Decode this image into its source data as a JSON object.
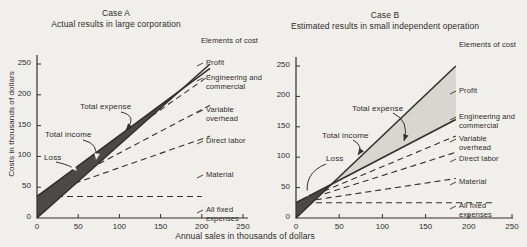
{
  "page": {
    "background": "#f1efec",
    "ink_color": "#34302b",
    "loss_fill_color": "#4b4a46",
    "profit_fill_color": "#d8d6d1"
  },
  "shared": {
    "x_axis_label": "Annual sales in thousands of dollars"
  },
  "chart_data": [
    {
      "type": "line",
      "title": "Case A",
      "subtitle": "Actual results in large corporation",
      "elements_header": "Elements of cost",
      "ylabel": "Costs in thousands of dollars",
      "xlim": [
        0,
        255
      ],
      "ylim": [
        0,
        265
      ],
      "x_ticks": [
        0,
        50,
        100,
        150,
        200,
        250
      ],
      "y_ticks": [
        0,
        50,
        100,
        150,
        200,
        250
      ],
      "grid": false,
      "legend_position": "right-margin",
      "break_even_sales_k": 175,
      "series": [
        {
          "name": "Total income",
          "style": "solid",
          "points": [
            [
              0,
              0
            ],
            [
              210,
              250
            ]
          ]
        },
        {
          "name": "Total expense",
          "style": "solid",
          "points": [
            [
              0,
              35
            ],
            [
              210,
              243
            ]
          ]
        },
        {
          "name": "Fixed + material + direct labor + variable overhead",
          "style": "dashed",
          "points": [
            [
              0,
              35
            ],
            [
              210,
              232
            ]
          ]
        },
        {
          "name": "Fixed + material + direct labor",
          "style": "dashed",
          "points": [
            [
              0,
              35
            ],
            [
              210,
              183
            ]
          ]
        },
        {
          "name": "Fixed + material",
          "style": "dashed",
          "points": [
            [
              0,
              35
            ],
            [
              210,
              133
            ]
          ]
        },
        {
          "name": "All fixed expenses",
          "style": "dashed",
          "points": [
            [
              0,
              35
            ],
            [
              200,
              35
            ]
          ]
        }
      ],
      "regions": [
        {
          "name": "Loss",
          "shade": "dark",
          "polygon": [
            [
              0,
              0
            ],
            [
              175,
              208
            ],
            [
              0,
              35
            ]
          ]
        }
      ],
      "annotations": [
        "Total expense",
        "Total income",
        "Loss"
      ],
      "cost_labels": [
        "Profit",
        "Engineering and commercial",
        "Variable overhead",
        "Direct labor",
        "Material",
        "All fixed expenses"
      ]
    },
    {
      "type": "line",
      "title": "Case B",
      "subtitle": "Estimated results in small independent operation",
      "elements_header": "Elements of cost",
      "ylabel": "",
      "xlim": [
        0,
        255
      ],
      "ylim": [
        0,
        265
      ],
      "x_ticks": [
        0,
        50,
        100,
        150,
        200,
        250
      ],
      "y_ticks": [
        0,
        50,
        100,
        150,
        200,
        250
      ],
      "grid": false,
      "legend_position": "right-margin",
      "break_even_sales_k": 41,
      "series": [
        {
          "name": "Total income",
          "style": "solid",
          "points": [
            [
              0,
              0
            ],
            [
              185,
              250
            ]
          ]
        },
        {
          "name": "Total expense",
          "style": "solid",
          "points": [
            [
              0,
              25
            ],
            [
              185,
              162
            ]
          ]
        },
        {
          "name": "Fixed + material + direct labor + variable overhead",
          "style": "dashed",
          "points": [
            [
              0,
              25
            ],
            [
              185,
              135
            ]
          ]
        },
        {
          "name": "Fixed + material + direct labor",
          "style": "dashed",
          "points": [
            [
              0,
              25
            ],
            [
              185,
              108
            ]
          ]
        },
        {
          "name": "Fixed + material",
          "style": "dashed",
          "points": [
            [
              0,
              25
            ],
            [
              185,
              65
            ]
          ]
        },
        {
          "name": "All fixed expenses",
          "style": "dashed",
          "points": [
            [
              0,
              25
            ],
            [
              230,
              25
            ]
          ]
        }
      ],
      "regions": [
        {
          "name": "Loss",
          "shade": "dark",
          "polygon": [
            [
              0,
              0
            ],
            [
              41,
              55
            ],
            [
              0,
              25
            ]
          ]
        },
        {
          "name": "Profit",
          "shade": "light",
          "polygon": [
            [
              41,
              55
            ],
            [
              185,
              250
            ],
            [
              185,
              162
            ]
          ]
        }
      ],
      "annotations": [
        "Total expense",
        "Total income",
        "Loss"
      ],
      "cost_labels": [
        "Profit",
        "Engineering and commercial",
        "Variable overhead",
        "Direct labor",
        "Material",
        "All fixed expenses"
      ]
    }
  ]
}
